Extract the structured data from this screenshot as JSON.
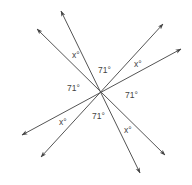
{
  "diagram": {
    "title": "",
    "center": {
      "x": 100,
      "y": 92
    },
    "colors": {
      "line": "#555555",
      "text": "#444444",
      "background": "#ffffff"
    },
    "lines": [
      {
        "id": "line-a",
        "x1": 37,
        "y1": 29,
        "x2": 165,
        "y2": 155
      },
      {
        "id": "line-b",
        "x1": 61,
        "y1": 11,
        "x2": 140,
        "y2": 173
      },
      {
        "id": "line-c",
        "x1": 163,
        "y1": 24,
        "x2": 41,
        "y2": 157
      },
      {
        "id": "line-d",
        "x1": 181,
        "y1": 49,
        "x2": 22,
        "y2": 135
      }
    ],
    "labels": [
      {
        "text": "x°",
        "x": 72,
        "y": 58
      },
      {
        "text": "71°",
        "x": 98,
        "y": 73
      },
      {
        "text": "x°",
        "x": 134,
        "y": 67
      },
      {
        "text": "71°",
        "x": 67,
        "y": 91
      },
      {
        "text": "71°",
        "x": 125,
        "y": 98
      },
      {
        "text": "x°",
        "x": 59,
        "y": 125
      },
      {
        "text": "71°",
        "x": 92,
        "y": 119
      },
      {
        "text": "x°",
        "x": 124,
        "y": 133
      }
    ]
  }
}
